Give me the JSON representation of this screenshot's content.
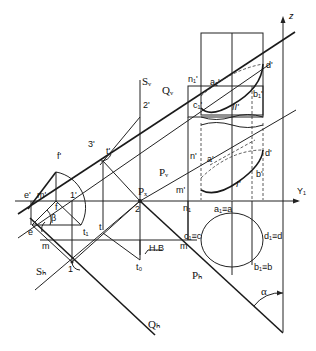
{
  "diagram": {
    "type": "descriptive-geometry-construction",
    "colors": {
      "line": "#222222",
      "background": "#ffffff"
    },
    "axes": {
      "horizontal_label": "Y₁",
      "vertical_label": "z"
    },
    "planes": {
      "S_v": "Sᵥ",
      "S_h": "Sₕ",
      "Q_v": "Qᵥ",
      "Q_h": "Qₕ",
      "P_v": "Pᵥ",
      "P_h": "Pₕ",
      "P_x": "Pₓ"
    },
    "points": {
      "two_prime": "2'",
      "two": "2",
      "three_prime": "3'",
      "t_prime": "t'",
      "f_prime": "f'",
      "e_prime": "e'",
      "m_prime_left": "m'",
      "one_prime": "1'",
      "f": "f",
      "e": "e",
      "beta": "β",
      "m_left": "m",
      "t1": "t₁",
      "t": "t",
      "t0": "t₀",
      "hb": "H.B",
      "one": "1",
      "n1_prime_top": "n₁'",
      "a1_prime": "a₁'",
      "c1_prime": "c₁'",
      "d_prime_top": "d'",
      "b1_prime": "b₁'",
      "II_prime": "II'",
      "n_prime": "n'",
      "a_prime": "a'",
      "d_prime": "d'",
      "b_prime": "b'",
      "m_prime_right": "m'",
      "I_prime": "I'",
      "n1": "n₁",
      "a1a": "a₁≡a",
      "c1c": "c₁≡c",
      "d1d": "d₁≡d",
      "b1b": "b₁≡b",
      "m_right": "m",
      "alpha": "α"
    }
  }
}
